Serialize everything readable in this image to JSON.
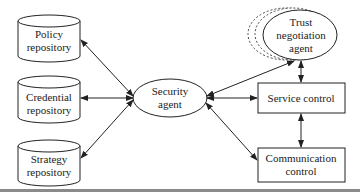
{
  "diagram": {
    "nodes": {
      "policy_repository": {
        "line1": "Policy",
        "line2": "repository",
        "shape": "cylinder"
      },
      "credential_repository": {
        "line1": "Credential",
        "line2": "repository",
        "shape": "cylinder"
      },
      "strategy_repository": {
        "line1": "Strategy",
        "line2": "repository",
        "shape": "cylinder"
      },
      "security_agent": {
        "line1": "Security",
        "line2": "agent",
        "shape": "ellipse"
      },
      "trust_negotiation_agent": {
        "line1": "Trust",
        "line2": "negotiation",
        "line3": "agent",
        "shape": "ellipse-stacked"
      },
      "service_control": {
        "line1": "Service control",
        "shape": "rectangle"
      },
      "communication_control": {
        "line1": "Communication",
        "line2": "control",
        "shape": "rectangle"
      }
    },
    "edges": [
      {
        "from": "security_agent",
        "to": "policy_repository",
        "direction": "both"
      },
      {
        "from": "security_agent",
        "to": "credential_repository",
        "direction": "both"
      },
      {
        "from": "security_agent",
        "to": "strategy_repository",
        "direction": "both"
      },
      {
        "from": "security_agent",
        "to": "trust_negotiation_agent",
        "direction": "both"
      },
      {
        "from": "security_agent",
        "to": "service_control",
        "direction": "both"
      },
      {
        "from": "security_agent",
        "to": "communication_control",
        "direction": "both"
      },
      {
        "from": "trust_negotiation_agent",
        "to": "service_control",
        "direction": "both"
      },
      {
        "from": "service_control",
        "to": "communication_control",
        "direction": "both"
      }
    ],
    "colors": {
      "stroke": "#222222",
      "background": "#ffffff"
    }
  }
}
